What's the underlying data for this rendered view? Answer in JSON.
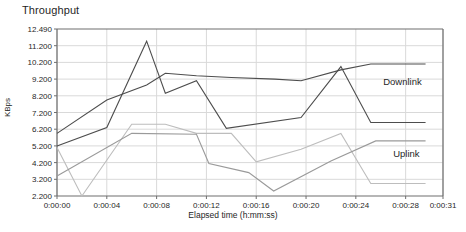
{
  "chart_data": {
    "type": "line",
    "title": "Throughput",
    "xlabel": "Elapsed time (h:mm:ss)",
    "ylabel": "KBps",
    "grid": true,
    "legend_position": "inline-annotation",
    "xlim": [
      0,
      31
    ],
    "ylim": [
      2.2,
      12.49
    ],
    "xtick_labels": [
      "0:00:00",
      "0:00:04",
      "0:00:08",
      "0:00:12",
      "0:00:16",
      "0:00:20",
      "0:00:24",
      "0:00:28",
      "0:00:31"
    ],
    "xtick_values": [
      0,
      4,
      8,
      12,
      16,
      20,
      24,
      28,
      31
    ],
    "ytick_labels": [
      "12.490",
      "11.200",
      "10.200",
      "9.200",
      "8.200",
      "7.200",
      "6.200",
      "5.200",
      "4.200",
      "3.200",
      "2.200"
    ],
    "ytick_values": [
      12.49,
      11.2,
      10.2,
      9.2,
      8.2,
      7.2,
      6.2,
      5.2,
      4.2,
      3.2,
      2.2
    ],
    "annotations": [
      {
        "text": "Downlink",
        "x": 26.2,
        "y": 8.85
      },
      {
        "text": "Uplink",
        "x": 27.0,
        "y": 4.55
      }
    ],
    "series": [
      {
        "name": "Downlink A",
        "color": "#4d4d4d",
        "points": [
          {
            "x": 0,
            "y": 5.95
          },
          {
            "x": 4,
            "y": 7.95
          },
          {
            "x": 7.2,
            "y": 8.85
          },
          {
            "x": 8.7,
            "y": 9.55
          },
          {
            "x": 11.2,
            "y": 9.4
          },
          {
            "x": 14,
            "y": 9.3
          },
          {
            "x": 17.5,
            "y": 9.2
          },
          {
            "x": 19.6,
            "y": 9.1
          },
          {
            "x": 22.8,
            "y": 9.75
          },
          {
            "x": 25.2,
            "y": 10.1
          },
          {
            "x": 29.6,
            "y": 10.1
          }
        ]
      },
      {
        "name": "Downlink B",
        "color": "#4d4d4d",
        "points": [
          {
            "x": 0,
            "y": 5.2
          },
          {
            "x": 4,
            "y": 6.3
          },
          {
            "x": 7.2,
            "y": 11.55
          },
          {
            "x": 8.7,
            "y": 8.35
          },
          {
            "x": 11.2,
            "y": 9.1
          },
          {
            "x": 13.6,
            "y": 6.25
          },
          {
            "x": 19.6,
            "y": 6.9
          },
          {
            "x": 22.8,
            "y": 9.95
          },
          {
            "x": 25.2,
            "y": 6.6
          },
          {
            "x": 29.6,
            "y": 6.6
          }
        ]
      },
      {
        "name": "Uplink A",
        "color": "#bdbdbd",
        "points": [
          {
            "x": 0,
            "y": 5.1
          },
          {
            "x": 2.0,
            "y": 2.2
          },
          {
            "x": 6.0,
            "y": 6.5
          },
          {
            "x": 8.7,
            "y": 6.5
          },
          {
            "x": 11.2,
            "y": 5.95
          },
          {
            "x": 14.0,
            "y": 5.95
          },
          {
            "x": 16.0,
            "y": 4.25
          },
          {
            "x": 19.6,
            "y": 5.0
          },
          {
            "x": 22.8,
            "y": 5.95
          },
          {
            "x": 25.2,
            "y": 2.95
          },
          {
            "x": 29.6,
            "y": 2.95
          }
        ]
      },
      {
        "name": "Uplink B",
        "color": "#9a9a9a",
        "points": [
          {
            "x": 0,
            "y": 3.4
          },
          {
            "x": 6.0,
            "y": 5.95
          },
          {
            "x": 11.2,
            "y": 5.9
          },
          {
            "x": 12.2,
            "y": 4.15
          },
          {
            "x": 15.4,
            "y": 3.6
          },
          {
            "x": 17.4,
            "y": 2.5
          },
          {
            "x": 22.0,
            "y": 4.3
          },
          {
            "x": 25.6,
            "y": 5.5
          },
          {
            "x": 29.6,
            "y": 5.5
          }
        ]
      }
    ]
  },
  "axes": {
    "plot_left": 57,
    "plot_right": 443,
    "plot_top": 29,
    "plot_bottom": 196
  },
  "colors": {
    "grid": "#d9d9d9",
    "axis": "#6e6e6e",
    "downlink": "#4d4d4d",
    "uplink": "#bdbdbd",
    "text": "#1f1f1f",
    "background": "#ffffff"
  }
}
